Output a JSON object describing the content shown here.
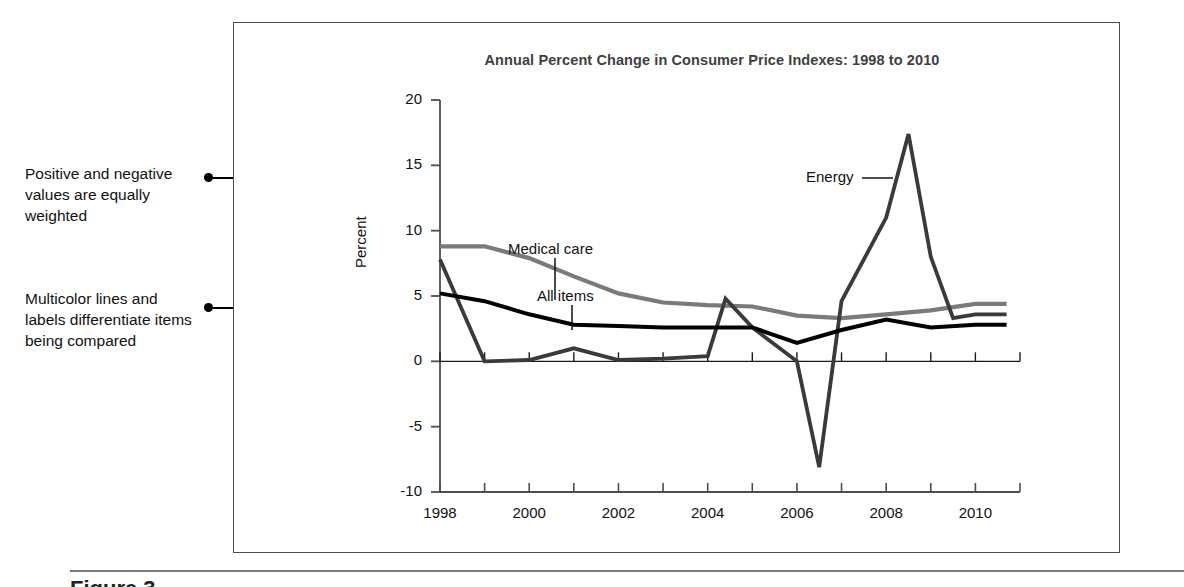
{
  "annotations": [
    {
      "id": "positive-negative",
      "text": "Positive and negative values are equally weighted"
    },
    {
      "id": "multicolor-lines",
      "text": "Multicolor lines and labels differentiate items being compared"
    }
  ],
  "caption_stub": "Figure 3.",
  "chart_data": {
    "type": "line",
    "title": "Annual Percent Change in Consumer Price Indexes: 1998 to 2010",
    "xlabel": "",
    "ylabel": "Percent",
    "xlim": [
      1998,
      2011
    ],
    "ylim": [
      -10,
      20
    ],
    "yticks": [
      20,
      15,
      10,
      5,
      0,
      -5,
      -10
    ],
    "xticks": [
      1998,
      1999,
      2000,
      2001,
      2002,
      2003,
      2004,
      2005,
      2006,
      2007,
      2008,
      2009,
      2010,
      2011
    ],
    "xtick_labels": [
      "1998",
      "2000",
      "2002",
      "2004",
      "2006",
      "2008",
      "2010"
    ],
    "xtick_labels_at": [
      1998,
      2000,
      2002,
      2004,
      2006,
      2008,
      2010
    ],
    "grid": false,
    "legend": "inline-labels",
    "zero_line": true,
    "series": [
      {
        "name": "Medical care",
        "color": "#7a7a7a",
        "label_at": {
          "x": 2000.6,
          "y": 12.6
        },
        "x": [
          1998,
          1999,
          2000,
          2001,
          2002,
          2003,
          2004,
          2005,
          2006,
          2007,
          2008,
          2009,
          2010,
          2010.7
        ],
        "values": [
          8.8,
          8.8,
          7.9,
          6.5,
          5.2,
          4.5,
          4.3,
          4.2,
          3.5,
          3.3,
          3.6,
          3.9,
          4.4,
          4.4
        ]
      },
      {
        "name": "All items",
        "color": "#000000",
        "label_at": {
          "x": 2000.4,
          "y": 8.6
        },
        "x": [
          1998,
          1999,
          2000,
          2001,
          2002,
          2003,
          2004,
          2005,
          2006,
          2007,
          2008,
          2009,
          2010,
          2010.7
        ],
        "values": [
          5.2,
          4.6,
          3.6,
          2.8,
          2.7,
          2.6,
          2.6,
          2.6,
          1.4,
          2.4,
          3.2,
          2.6,
          2.8,
          2.8
        ]
      },
      {
        "name": "Energy",
        "color": "#3a3a3a",
        "label_at": {
          "x": 2006.6,
          "y": 15.8
        },
        "x": [
          1998,
          1999,
          2000,
          2001,
          2002,
          2003,
          2004,
          2004.4,
          2005,
          2006,
          2006.5,
          2007,
          2008,
          2008.5,
          2009,
          2009.5,
          2010,
          2010.7
        ],
        "values": [
          7.8,
          0.0,
          0.1,
          1.0,
          0.1,
          0.2,
          0.4,
          4.8,
          2.6,
          0.0,
          -8.1,
          4.6,
          11.0,
          17.4,
          8.0,
          3.3,
          3.6,
          3.6
        ]
      }
    ]
  }
}
